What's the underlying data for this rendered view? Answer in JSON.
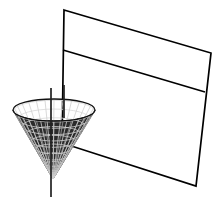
{
  "figure": {
    "caption": "",
    "width": 222,
    "height": 207,
    "background_color": "#ffffff",
    "line_color": "#000000",
    "mesh_color": "#111111",
    "shade_color": "#1a1a1a",
    "axis_color": "#222222"
  },
  "chart_data": {
    "type": "diagram",
    "xlabel": "",
    "ylabel": "",
    "grid": false,
    "legend": null,
    "objects": [
      {
        "name": "plane",
        "kind": "quadrilateral",
        "label": "slanted cutting plane",
        "stroke": "#000000",
        "fill": "none",
        "stroke_width": 1.6,
        "points": [
          [
            64,
            10
          ],
          [
            211,
            53
          ],
          [
            196,
            186
          ],
          [
            62,
            143
          ]
        ]
      },
      {
        "name": "plane-mid-line",
        "kind": "line",
        "label": "horizontal division line on plane",
        "stroke": "#000000",
        "stroke_width": 1.6,
        "points": [
          [
            63,
            50
          ],
          [
            205,
            92
          ]
        ]
      },
      {
        "name": "cone",
        "kind": "cone-mesh",
        "label": "inverted wireframe cone",
        "apex": [
          53,
          179
        ],
        "rim_center": [
          54,
          110
        ],
        "rim_rx": 41,
        "rim_ry": 11,
        "meridians": 28,
        "parallels": 9,
        "stroke": "#111111",
        "fill": "#2b2b2b"
      },
      {
        "name": "cone-axis",
        "kind": "line",
        "label": "vertical axis of cone",
        "stroke": "#222222",
        "stroke_width": 1.6,
        "points": [
          [
            51,
            88
          ],
          [
            51,
            197
          ]
        ]
      },
      {
        "name": "cone-axis-secondary",
        "kind": "line",
        "label": "secondary vertical line through cone",
        "stroke": "#222222",
        "stroke_width": 1.6,
        "points": [
          [
            64,
            85
          ],
          [
            64,
            118
          ]
        ]
      }
    ],
    "annotations": []
  }
}
